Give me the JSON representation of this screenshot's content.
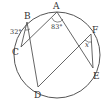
{
  "diagram": {
    "type": "circle-inscribed-angles",
    "points": {
      "A": {
        "label": "A",
        "x": 57,
        "y": 12
      },
      "B": {
        "label": "B",
        "x": 27,
        "y": 22
      },
      "C": {
        "label": "C",
        "x": 21,
        "y": 47
      },
      "D": {
        "label": "D",
        "x": 38,
        "y": 86
      },
      "E": {
        "label": "E",
        "x": 93,
        "y": 68
      },
      "F": {
        "label": "F",
        "x": 91,
        "y": 34
      }
    },
    "segments": [
      [
        "C",
        "B"
      ],
      [
        "B",
        "D"
      ],
      [
        "C",
        "A"
      ],
      [
        "A",
        "E"
      ],
      [
        "D",
        "F"
      ],
      [
        "F",
        "E"
      ]
    ],
    "angles": {
      "at_A": "83°",
      "at_B": "32°",
      "at_F": "x"
    },
    "stroke_color": "#555555"
  }
}
